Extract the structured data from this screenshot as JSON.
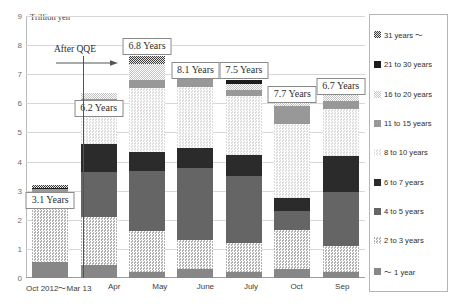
{
  "axis": {
    "y_title": "Trillion yen",
    "y_ticks": [
      "9",
      "8",
      "7",
      "6",
      "5",
      "4",
      "3",
      "2",
      "1",
      "0"
    ],
    "x_ticks": [
      "Oct 2012～Mar 13",
      "Apr",
      "May",
      "June",
      "July",
      "Oct",
      "Sep"
    ]
  },
  "annotation": {
    "qqe_label": "After QQE"
  },
  "callouts": [
    "3.1 Years",
    "6.2 Years",
    "6.8 Years",
    "8.1 Years",
    "7.5 Years",
    "7.7 Years",
    "6.7 Years"
  ],
  "legend": {
    "items": [
      {
        "label": "31 years ～",
        "key": "y31"
      },
      {
        "label": "21 to 30 years",
        "key": "y2130"
      },
      {
        "label": "16 to 20 years",
        "key": "y1620"
      },
      {
        "label": "11 to 15 years",
        "key": "y1115"
      },
      {
        "label": "8 to 10 years",
        "key": "y810"
      },
      {
        "label": "6 to 7 years",
        "key": "y67"
      },
      {
        "label": "4 to 5 years",
        "key": "y45"
      },
      {
        "label": "2 to 3 years",
        "key": "y23"
      },
      {
        "label": "～ 1 year",
        "key": "y1"
      }
    ]
  },
  "chart_data": {
    "type": "bar",
    "stacked": true,
    "title": "",
    "xlabel": "",
    "ylabel": "Trillion yen",
    "ylim": [
      0,
      9
    ],
    "ytick_step": 1,
    "grid": true,
    "legend_position": "right",
    "categories": [
      "Oct 2012～Mar 13",
      "Apr",
      "May",
      "June",
      "July",
      "Oct",
      "Sep"
    ],
    "annotations": [
      {
        "text": "After QQE",
        "type": "arrow-label"
      },
      {
        "text": "3.1 Years",
        "category": "Oct 2012～Mar 13"
      },
      {
        "text": "6.2 Years",
        "category": "Apr"
      },
      {
        "text": "6.8 Years",
        "category": "May"
      },
      {
        "text": "8.1 Years",
        "category": "June"
      },
      {
        "text": "7.5 Years",
        "category": "July"
      },
      {
        "text": "7.7 Years",
        "category": "Oct"
      },
      {
        "text": "6.7 Years",
        "category": "Sep"
      }
    ],
    "series": [
      {
        "name": "～ 1 year",
        "key": "y1",
        "values": [
          0.55,
          0.45,
          0.22,
          0.32,
          0.22,
          0.3,
          0.2
        ]
      },
      {
        "name": "2 to 3 years",
        "key": "y23",
        "values": [
          2.3,
          1.65,
          1.4,
          1.0,
          1.0,
          1.35,
          0.9
        ]
      },
      {
        "name": "4 to 5 years",
        "key": "y45",
        "values": [
          0.0,
          1.55,
          2.05,
          2.45,
          2.3,
          0.65,
          1.85
        ]
      },
      {
        "name": "6 to 7 years",
        "key": "y67",
        "values": [
          0.0,
          0.95,
          0.65,
          0.7,
          0.7,
          0.45,
          1.25
        ]
      },
      {
        "name": "8 to 10 years",
        "key": "y810",
        "values": [
          0.1,
          1.3,
          2.2,
          2.1,
          2.05,
          2.55,
          1.6
        ]
      },
      {
        "name": "11 to 15 years",
        "key": "y1115",
        "values": [
          0.1,
          0.25,
          0.3,
          0.3,
          0.2,
          0.6,
          0.3
        ]
      },
      {
        "name": "16 to 20 years",
        "key": "y1620",
        "values": [
          0.0,
          0.2,
          0.55,
          0.25,
          0.2,
          0.12,
          0.2
        ]
      },
      {
        "name": "21 to 30 years",
        "key": "y2130",
        "values": [
          0.05,
          0.0,
          0.0,
          0.15,
          0.12,
          0.12,
          0.0
        ]
      },
      {
        "name": "31 years ～",
        "key": "y31",
        "values": [
          0.1,
          0.0,
          0.25,
          0.12,
          0.0,
          0.0,
          0.12
        ]
      }
    ],
    "totals": [
      3.2,
      6.35,
      7.62,
      7.39,
      6.79,
      6.14,
      6.42
    ],
    "avg_maturity_years": [
      3.1,
      6.2,
      6.8,
      8.1,
      7.5,
      7.7,
      6.7
    ]
  }
}
